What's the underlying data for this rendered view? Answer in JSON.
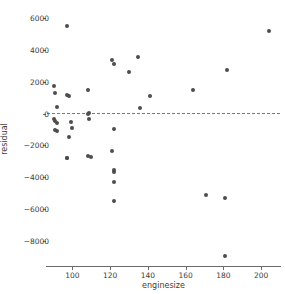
{
  "chart_data": {
    "type": "scatter",
    "title": "",
    "xlabel": "enginesize",
    "ylabel": "residual",
    "xlim": [
      86,
      210
    ],
    "ylim": [
      -9600,
      6400
    ],
    "grid": false,
    "legend": null,
    "xticks": [
      100,
      120,
      140,
      160,
      180,
      200
    ],
    "xticklabels": [
      "100",
      "120",
      "140",
      "160",
      "180",
      "200"
    ],
    "yticks": [
      -8000,
      -6000,
      -4000,
      -2000,
      0,
      2000,
      4000,
      6000
    ],
    "yticklabels": [
      "−8000",
      "−6000",
      "−4000",
      "−2000",
      "0",
      "2000",
      "4000",
      "6000"
    ],
    "reference_line": {
      "type": "horizontal",
      "value": 0,
      "style": "dashed",
      "color": "#7a7a7a"
    },
    "marker": {
      "shape": "circle",
      "color": "#4d4d4d",
      "size": 4
    },
    "x": [
      97,
      204,
      121,
      122,
      135,
      130,
      182,
      90,
      164,
      108,
      91,
      97,
      98,
      141,
      92,
      136,
      109,
      108,
      90,
      91,
      92,
      99,
      100,
      109,
      91,
      92,
      98,
      122,
      97,
      108,
      110,
      121,
      97,
      122,
      122,
      122,
      171,
      181,
      122,
      181
    ],
    "y": [
      5500,
      5200,
      3350,
      3150,
      3580,
      2620,
      2720,
      1770,
      1480,
      1480,
      1300,
      1150,
      1100,
      1100,
      400,
      350,
      50,
      -30,
      -350,
      -480,
      -570,
      -520,
      -880,
      -330,
      -1050,
      -1120,
      -1500,
      -1000,
      -2820,
      -2680,
      -2760,
      -2350,
      -2820,
      -3550,
      -3700,
      -4320,
      -5100,
      -5300,
      -5500,
      -8980
    ],
    "n_points": 40
  },
  "axes": {
    "xlabel": "enginesize",
    "ylabel": "residual"
  }
}
